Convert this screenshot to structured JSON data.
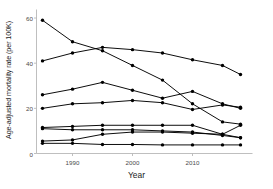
{
  "chart_data": {
    "type": "line",
    "title": "",
    "xlabel": "Year",
    "ylabel": "Age-adjusted mortality rate (per 100K)",
    "x": [
      1985,
      1990,
      1995,
      2000,
      2005,
      2010,
      2015,
      2018
    ],
    "xlim": [
      1984,
      2019
    ],
    "ylim": [
      0,
      62
    ],
    "xticks": [
      1990,
      2000,
      2010
    ],
    "xtick_labels": [
      "1990",
      "2000",
      "2010"
    ],
    "yticks": [
      0,
      20,
      40,
      60
    ],
    "ytick_labels": [
      "0",
      "20",
      "40",
      "60"
    ],
    "grid": false,
    "legend": "none",
    "marker": "filled-circle",
    "line_color": "#000000",
    "series": [
      {
        "name": "series-1",
        "values": [
          59.0,
          49.5,
          45.5,
          39.0,
          32.5,
          22.0,
          14.0,
          13.0
        ]
      },
      {
        "name": "series-2",
        "values": [
          41.0,
          44.5,
          47.0,
          46.0,
          44.5,
          41.5,
          39.0,
          35.0
        ]
      },
      {
        "name": "series-3",
        "values": [
          26.0,
          28.5,
          31.5,
          28.0,
          24.5,
          27.5,
          22.0,
          20.0
        ]
      },
      {
        "name": "series-4",
        "values": [
          20.0,
          22.0,
          22.5,
          23.5,
          22.5,
          19.5,
          21.5,
          20.5
        ]
      },
      {
        "name": "series-5",
        "values": [
          11.5,
          12.0,
          12.5,
          12.5,
          12.5,
          12.5,
          8.5,
          12.5
        ]
      },
      {
        "name": "series-6",
        "values": [
          11.0,
          10.5,
          10.5,
          10.5,
          10.0,
          9.5,
          8.0,
          7.0
        ]
      },
      {
        "name": "series-7",
        "values": [
          5.5,
          6.0,
          8.5,
          9.5,
          9.5,
          9.0,
          8.5,
          7.0
        ]
      },
      {
        "name": "series-8",
        "values": [
          4.5,
          4.5,
          4.0,
          4.0,
          3.8,
          3.8,
          3.8,
          3.8
        ]
      }
    ]
  }
}
